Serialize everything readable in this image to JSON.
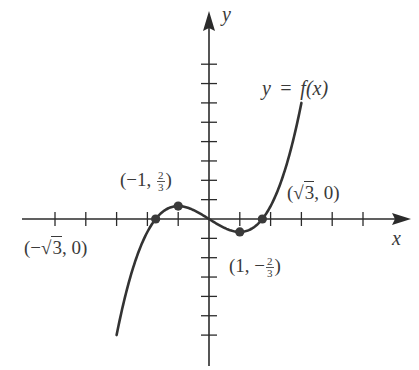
{
  "chart_data": {
    "type": "line",
    "title": "",
    "function_label": "y = f(x)",
    "function": "f(x) = x^3/3 - x",
    "xlabel": "x",
    "ylabel": "y",
    "xlim": [
      -5,
      6.5
    ],
    "ylim": [
      -7,
      8.5
    ],
    "x_ticks": [
      -5,
      -4,
      -3,
      -2,
      -1,
      1,
      2,
      3,
      4,
      5
    ],
    "y_ticks": [
      -6,
      -5,
      -4,
      -3,
      -2,
      -1,
      1,
      2,
      3,
      4,
      5,
      6,
      7,
      8
    ],
    "tick_labels_shown": false,
    "grid": false,
    "curve_domain": [
      -3,
      3
    ],
    "series": [
      {
        "name": "y = f(x)",
        "x": [
          -3,
          -2.5,
          -2,
          -1.732,
          -1.5,
          -1,
          -0.5,
          0,
          0.5,
          1,
          1.5,
          1.732,
          2,
          2.5,
          3
        ],
        "y": [
          -6,
          -2.708,
          -0.667,
          0,
          0.375,
          0.667,
          0.458,
          0,
          -0.458,
          -0.667,
          -0.375,
          0,
          0.667,
          2.708,
          6
        ]
      }
    ],
    "marked_points": [
      {
        "x": -1.732,
        "y": 0,
        "label": "(−√3, 0)"
      },
      {
        "x": -1,
        "y": 0.667,
        "label": "(−1, 2/3)"
      },
      {
        "x": 1,
        "y": -0.667,
        "label": "(1, −2/3)"
      },
      {
        "x": 1.732,
        "y": 0,
        "label": "(√3, 0)"
      }
    ]
  },
  "labels": {
    "y_axis": "y",
    "x_axis": "x",
    "func": "y = f(x)",
    "pt_neg_root": {
      "open": "(−",
      "rad": "3",
      "close": ", 0)"
    },
    "pt_max": {
      "open": "(−1, ",
      "num": "2",
      "den": "3",
      "close": ")"
    },
    "pt_min": {
      "open": "(1, −",
      "num": "2",
      "den": "3",
      "close": ")"
    },
    "pt_pos_root": {
      "open": "(",
      "rad": "3",
      "close": ", 0)"
    }
  },
  "style": {
    "axis_color": "#2b2b2b",
    "curve_color": "#333333",
    "point_color": "#3a3a3a",
    "text_color": "#3a3a3a"
  }
}
